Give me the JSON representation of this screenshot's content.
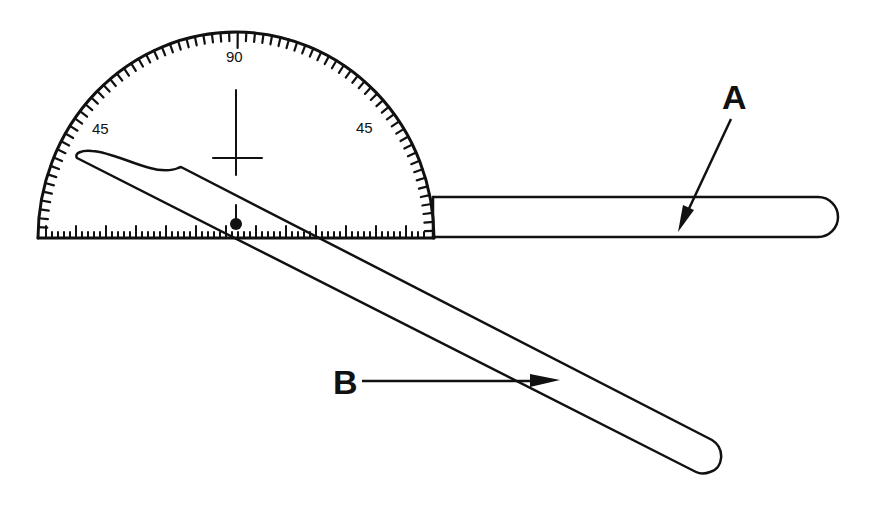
{
  "figure": {
    "colors": {
      "ink": "#111111",
      "background": "#ffffff"
    },
    "protractor": {
      "scale_labels": [
        {
          "text": "45",
          "position": "left"
        },
        {
          "text": "90",
          "position": "top"
        },
        {
          "text": "45",
          "position": "right"
        }
      ]
    },
    "callouts": {
      "A": {
        "label": "A",
        "target": "stationary-arm"
      },
      "B": {
        "label": "B",
        "target": "moving-arm"
      }
    }
  }
}
